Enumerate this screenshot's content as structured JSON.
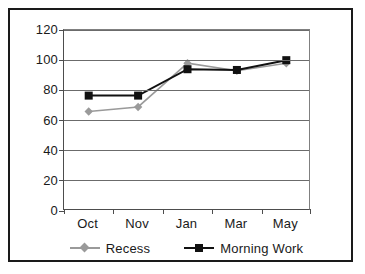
{
  "chart_data": {
    "type": "line",
    "title": "",
    "xlabel": "",
    "ylabel": "Percentage",
    "categories": [
      "Oct",
      "Nov",
      "Jan",
      "Mar",
      "May"
    ],
    "ylim": [
      0,
      120
    ],
    "yticks": [
      0,
      20,
      40,
      60,
      80,
      100,
      120
    ],
    "ytick_labels": [
      "0",
      "20",
      "40",
      "60",
      "80",
      "100",
      "120"
    ],
    "grid": "horizontal",
    "legend_position": "bottom",
    "series": [
      {
        "name": "Recess",
        "color": "#9a9a9a",
        "marker": "diamond",
        "values": [
          66,
          69,
          98,
          93,
          98
        ]
      },
      {
        "name": "Morning Work",
        "color": "#111111",
        "marker": "square",
        "values": [
          76.5,
          76.5,
          94,
          93.5,
          100
        ]
      }
    ]
  },
  "legend": {
    "items": [
      {
        "label": "Recess"
      },
      {
        "label": "Morning Work"
      }
    ]
  }
}
